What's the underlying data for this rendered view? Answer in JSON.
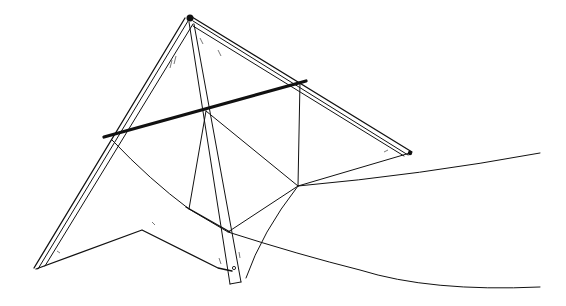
{
  "image": {
    "subject": "Delta kite line drawing",
    "style": "black ink illustration on white",
    "colors": {
      "ink": "#111111",
      "background": "#ffffff"
    }
  },
  "elements": {
    "kite_sail": "Delta-shaped sail with trailing-edge notch",
    "leading_edges": "Two double-line leading edge spars meeting at nose",
    "spreader": "Thick cross spar",
    "spine": "Central keel spar ending in tab",
    "bridle": "Bridle lines converging at tow point",
    "flying_lines": "Two curved lines trailing off to the right"
  }
}
